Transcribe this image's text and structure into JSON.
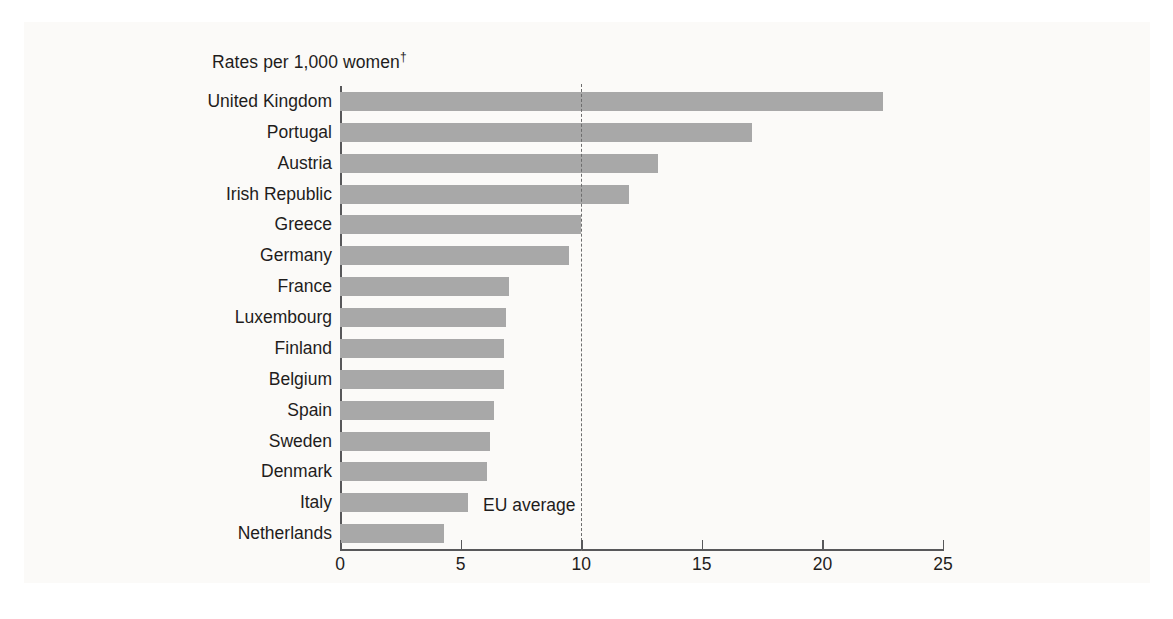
{
  "figure": {
    "units_note": "Rates per 1,000 women",
    "units_note_marker": "†",
    "reference_label": "EU average"
  },
  "chart_data": {
    "type": "bar",
    "orientation": "horizontal",
    "title": "",
    "subtitle": "",
    "xlabel": "Rates per 1,000 women †",
    "ylabel": "",
    "xlim": [
      0,
      25
    ],
    "xticks": [
      0,
      5,
      10,
      15,
      20,
      25
    ],
    "xtick_labels": [
      "0",
      "5",
      "10",
      "15",
      "20",
      "25"
    ],
    "grid": false,
    "legend": "none",
    "bar_color": "#a8a8a8",
    "categories": [
      "United Kingdom",
      "Portugal",
      "Austria",
      "Irish Republic",
      "Greece",
      "Germany",
      "France",
      "Luxembourg",
      "Finland",
      "Belgium",
      "Spain",
      "Sweden",
      "Denmark",
      "Italy",
      "Netherlands"
    ],
    "values": [
      22.5,
      17.1,
      13.2,
      12.0,
      10.0,
      9.5,
      7.0,
      6.9,
      6.8,
      6.8,
      6.4,
      6.2,
      6.1,
      5.3,
      4.3
    ],
    "annotations": [
      {
        "text": "EU average",
        "type": "reference-line",
        "value": 10.0,
        "style": "dashed"
      }
    ]
  }
}
